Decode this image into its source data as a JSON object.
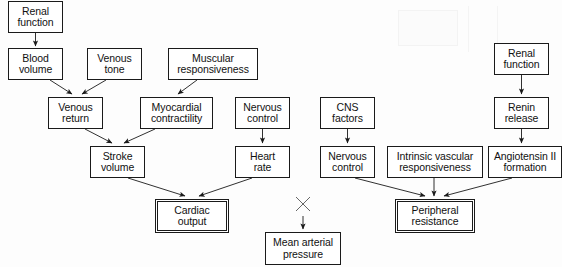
{
  "diagram": {
    "type": "flowchart",
    "canvas": {
      "width": 562,
      "height": 267
    },
    "colors": {
      "background": "#fdfdfd",
      "node_border": "#1a1a1a",
      "node_fill": "#ffffff",
      "edge": "#1a1a1a",
      "text": "#111111"
    },
    "nodes": [
      {
        "id": "renal_function_left",
        "label": "Renal\nfunction",
        "x": 8,
        "y": 1,
        "w": 55,
        "h": 32,
        "emphasis": false
      },
      {
        "id": "blood_volume",
        "label": "Blood\nvolume",
        "x": 8,
        "y": 48,
        "w": 55,
        "h": 32,
        "emphasis": false
      },
      {
        "id": "venous_tone",
        "label": "Venous\ntone",
        "x": 87,
        "y": 48,
        "w": 55,
        "h": 32,
        "emphasis": false
      },
      {
        "id": "muscular_responsiveness",
        "label": "Muscular\nresponsiveness",
        "x": 168,
        "y": 48,
        "w": 90,
        "h": 32,
        "emphasis": false
      },
      {
        "id": "venous_return",
        "label": "Venous\nreturn",
        "x": 48,
        "y": 97,
        "w": 55,
        "h": 32,
        "emphasis": false
      },
      {
        "id": "myocardial_contractility",
        "label": "Myocardial\ncontractility",
        "x": 140,
        "y": 97,
        "w": 73,
        "h": 32,
        "emphasis": false
      },
      {
        "id": "nervous_control_cardiac",
        "label": "Nervous\ncontrol",
        "x": 235,
        "y": 97,
        "w": 55,
        "h": 32,
        "emphasis": false
      },
      {
        "id": "stroke_volume",
        "label": "Stroke\nvolume",
        "x": 90,
        "y": 146,
        "w": 55,
        "h": 32,
        "emphasis": false
      },
      {
        "id": "heart_rate",
        "label": "Heart\nrate",
        "x": 235,
        "y": 146,
        "w": 55,
        "h": 32,
        "emphasis": false
      },
      {
        "id": "cardiac_output",
        "label": "Cardiac\noutput",
        "x": 155,
        "y": 199,
        "w": 74,
        "h": 34,
        "emphasis": true
      },
      {
        "id": "cns_factors",
        "label": "CNS\nfactors",
        "x": 320,
        "y": 97,
        "w": 55,
        "h": 32,
        "emphasis": false
      },
      {
        "id": "nervous_control_resistance",
        "label": "Nervous\ncontrol",
        "x": 320,
        "y": 146,
        "w": 55,
        "h": 32,
        "emphasis": false
      },
      {
        "id": "intrinsic_vascular_responsiveness",
        "label": "Intrinsic vascular\nresponsiveness",
        "x": 387,
        "y": 146,
        "w": 96,
        "h": 32,
        "emphasis": false
      },
      {
        "id": "renal_function_right",
        "label": "Renal\nfunction",
        "x": 494,
        "y": 43,
        "w": 55,
        "h": 32,
        "emphasis": false
      },
      {
        "id": "renin_release",
        "label": "Renin\nrelease",
        "x": 494,
        "y": 97,
        "w": 55,
        "h": 32,
        "emphasis": false
      },
      {
        "id": "angiotensin_ii_formation",
        "label": "Angiotensin II\nformation",
        "x": 488,
        "y": 146,
        "w": 74,
        "h": 32,
        "emphasis": false
      },
      {
        "id": "peripheral_resistance",
        "label": "Peripheral\nresistance",
        "x": 395,
        "y": 199,
        "w": 80,
        "h": 34,
        "emphasis": true
      },
      {
        "id": "mean_arterial_pressure",
        "label": "Mean arterial\npressure",
        "x": 265,
        "y": 232,
        "w": 76,
        "h": 33,
        "emphasis": false
      }
    ],
    "edges": [
      {
        "from": "renal_function_left",
        "to": "blood_volume",
        "style": "straight-arrow"
      },
      {
        "from": "blood_volume",
        "to": "venous_return",
        "style": "diagonal-arrow"
      },
      {
        "from": "venous_tone",
        "to": "venous_return",
        "style": "diagonal-arrow"
      },
      {
        "from": "muscular_responsiveness",
        "to": "myocardial_contractility",
        "style": "diagonal-arrow"
      },
      {
        "from": "venous_return",
        "to": "stroke_volume",
        "style": "diagonal-arrow"
      },
      {
        "from": "myocardial_contractility",
        "to": "stroke_volume",
        "style": "diagonal-arrow"
      },
      {
        "from": "nervous_control_cardiac",
        "to": "heart_rate",
        "style": "straight-arrow"
      },
      {
        "from": "stroke_volume",
        "to": "cardiac_output",
        "style": "diagonal-arrow"
      },
      {
        "from": "heart_rate",
        "to": "cardiac_output",
        "style": "diagonal-arrow"
      },
      {
        "from": "cns_factors",
        "to": "nervous_control_resistance",
        "style": "straight-arrow"
      },
      {
        "from": "renal_function_right",
        "to": "renin_release",
        "style": "straight-arrow"
      },
      {
        "from": "renin_release",
        "to": "angiotensin_ii_formation",
        "style": "straight-arrow"
      },
      {
        "from": "nervous_control_resistance",
        "to": "peripheral_resistance",
        "style": "diagonal-arrow"
      },
      {
        "from": "intrinsic_vascular_responsiveness",
        "to": "peripheral_resistance",
        "style": "straight-arrow"
      },
      {
        "from": "angiotensin_ii_formation",
        "to": "peripheral_resistance",
        "style": "diagonal-arrow"
      },
      {
        "from": "cross_mark",
        "to": "mean_arterial_pressure",
        "style": "straight-arrow"
      }
    ],
    "markers": [
      {
        "id": "cross_mark",
        "type": "x-cross",
        "x": 303,
        "y": 203,
        "size": 14
      }
    ]
  }
}
